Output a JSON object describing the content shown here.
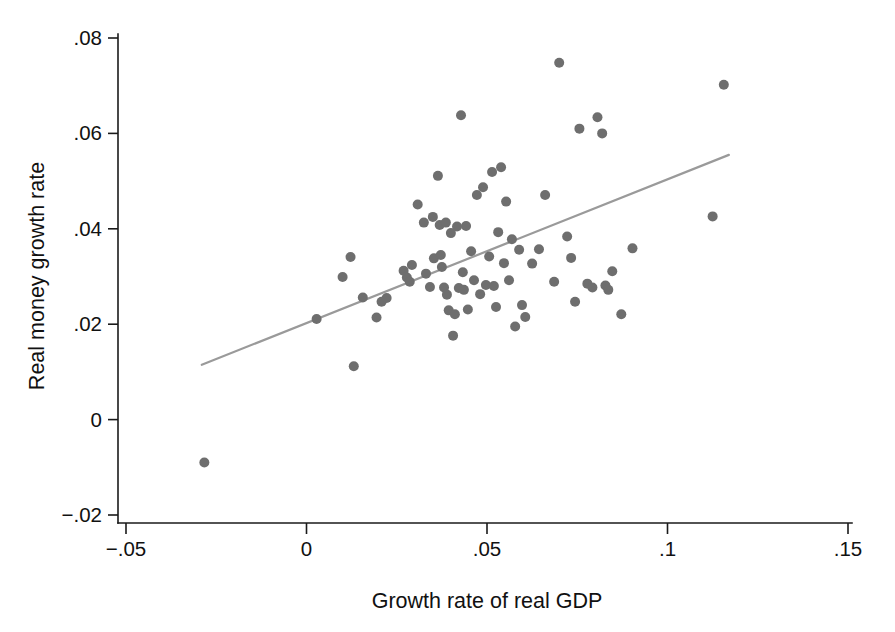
{
  "chart_data": {
    "type": "scatter",
    "title": "",
    "xlabel": "Growth rate of real GDP",
    "ylabel": "Real money growth rate",
    "xlim": [
      -0.05,
      0.15
    ],
    "ylim": [
      -0.02,
      0.08
    ],
    "xticks": [
      -0.05,
      0,
      0.05,
      0.1,
      0.15
    ],
    "xtick_labels": [
      "−.05",
      "0",
      ".05",
      ".1",
      ".15"
    ],
    "yticks": [
      -0.02,
      0,
      0.02,
      0.04,
      0.06,
      0.08
    ],
    "ytick_labels": [
      "−.02",
      "0",
      ".02",
      ".04",
      ".06",
      ".08"
    ],
    "grid": false,
    "legend": null,
    "marker_color": "#6e6e6e",
    "marker_size": 5,
    "fit_line": {
      "name": "linear fit",
      "color": "#9a9a9a",
      "x_start": -0.029,
      "y_start": 0.0115,
      "x_end": 0.117,
      "y_end": 0.0555
    },
    "x": [
      -0.0283,
      0.0028,
      0.01,
      0.0122,
      0.0131,
      0.0156,
      0.0194,
      0.0208,
      0.0222,
      0.0269,
      0.0278,
      0.0286,
      0.0292,
      0.0308,
      0.0325,
      0.0331,
      0.0342,
      0.035,
      0.0353,
      0.0364,
      0.0369,
      0.0372,
      0.0375,
      0.0381,
      0.0386,
      0.0389,
      0.0394,
      0.04,
      0.0406,
      0.0411,
      0.0417,
      0.0422,
      0.0428,
      0.0433,
      0.0436,
      0.0442,
      0.0447,
      0.0456,
      0.0464,
      0.0472,
      0.0481,
      0.0489,
      0.0497,
      0.0506,
      0.0514,
      0.0519,
      0.0525,
      0.0531,
      0.0539,
      0.0547,
      0.0553,
      0.0561,
      0.0569,
      0.0578,
      0.0589,
      0.0597,
      0.0606,
      0.0625,
      0.0644,
      0.0661,
      0.0686,
      0.07,
      0.0722,
      0.0733,
      0.0744,
      0.0756,
      0.0778,
      0.0792,
      0.0806,
      0.0819,
      0.0828,
      0.0836,
      0.0847,
      0.0872,
      0.0903,
      0.1125,
      0.1156
    ],
    "y": [
      -0.009,
      0.0211,
      0.0299,
      0.0341,
      0.0112,
      0.0256,
      0.0214,
      0.0247,
      0.0255,
      0.0312,
      0.0298,
      0.0289,
      0.0324,
      0.0451,
      0.0413,
      0.0306,
      0.0278,
      0.0425,
      0.0338,
      0.0511,
      0.0408,
      0.0345,
      0.032,
      0.0277,
      0.0413,
      0.0262,
      0.0229,
      0.0391,
      0.0176,
      0.0221,
      0.0405,
      0.0276,
      0.0638,
      0.0309,
      0.0272,
      0.0406,
      0.0231,
      0.0353,
      0.0292,
      0.0471,
      0.0263,
      0.0487,
      0.0282,
      0.0342,
      0.0519,
      0.028,
      0.0236,
      0.0393,
      0.0529,
      0.0328,
      0.0457,
      0.0292,
      0.0378,
      0.0195,
      0.0356,
      0.024,
      0.0215,
      0.0327,
      0.0357,
      0.0471,
      0.0289,
      0.0748,
      0.0384,
      0.0339,
      0.0247,
      0.061,
      0.0285,
      0.0277,
      0.0634,
      0.06,
      0.0281,
      0.0272,
      0.0311,
      0.0221,
      0.0359,
      0.0426,
      0.0702
    ]
  }
}
